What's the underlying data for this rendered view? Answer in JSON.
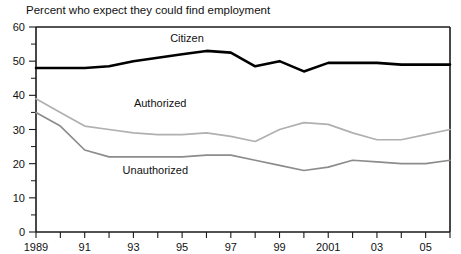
{
  "chart_data": {
    "type": "line",
    "title": "Percent who expect they could find employment",
    "xlabel": "",
    "ylabel": "",
    "ylim": [
      0,
      60
    ],
    "xlim": [
      1989,
      2006
    ],
    "grid": false,
    "legend_position": "inline-labels",
    "y_ticks_major": [
      0,
      10,
      20,
      30,
      40,
      50,
      60
    ],
    "y_ticks_minor": [
      5,
      15,
      25,
      35,
      45,
      55
    ],
    "x_ticks": [
      1989,
      1990,
      1991,
      1992,
      1993,
      1994,
      1995,
      1996,
      1997,
      1998,
      1999,
      2000,
      2001,
      2002,
      2003,
      2004,
      2005,
      2006
    ],
    "x_tick_labels": [
      {
        "x": 1989,
        "label": "1989"
      },
      {
        "x": 1991,
        "label": "91"
      },
      {
        "x": 1993,
        "label": "93"
      },
      {
        "x": 1995,
        "label": "95"
      },
      {
        "x": 1997,
        "label": "97"
      },
      {
        "x": 1999,
        "label": "99"
      },
      {
        "x": 2001,
        "label": "2001"
      },
      {
        "x": 2003,
        "label": "03"
      },
      {
        "x": 2005,
        "label": "05"
      }
    ],
    "x": [
      1989,
      1990,
      1991,
      1992,
      1993,
      1994,
      1995,
      1996,
      1997,
      1998,
      1999,
      2000,
      2001,
      2002,
      2003,
      2004,
      2005,
      2006
    ],
    "series": [
      {
        "name": "Citizen",
        "color": "#000000",
        "width": 2.6,
        "label_x": 1995.2,
        "label_y": 55.5,
        "values": [
          48,
          48,
          48,
          48.5,
          50,
          51,
          52,
          53,
          52.5,
          48.5,
          50,
          47,
          49.5,
          49.5,
          49.5,
          49,
          49,
          49
        ]
      },
      {
        "name": "Authorized",
        "color": "#b0b0b0",
        "width": 1.7,
        "label_x": 1994.1,
        "label_y": 36.5,
        "values": [
          39,
          35,
          31,
          30,
          29,
          28.5,
          28.5,
          29,
          28,
          26.5,
          30,
          32,
          31.5,
          29,
          27,
          27,
          28.5,
          30
        ]
      },
      {
        "name": "Unauthorized",
        "color": "#8c8c8c",
        "width": 1.7,
        "label_x": 1993.9,
        "label_y": 17.0,
        "values": [
          35,
          31,
          24,
          22,
          22,
          22,
          22,
          22.5,
          22.5,
          21,
          19.5,
          18,
          19,
          21,
          20.5,
          20,
          20,
          21
        ]
      }
    ]
  }
}
